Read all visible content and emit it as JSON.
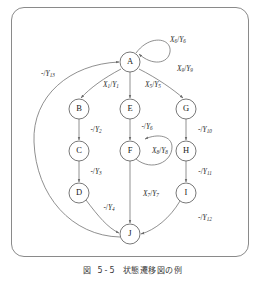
{
  "figure": {
    "caption_number": "図 5-5",
    "caption_text": "状態遷移図の例",
    "frame_color": "#8a8a8a",
    "node_stroke_color": "#555555",
    "edge_color": "#6b6b6b"
  },
  "chart_data": {
    "type": "diagram",
    "title": "状態遷移図の例",
    "diagram_kind": "state-transition-diagram",
    "nodes": [
      {
        "id": "A",
        "label": "A",
        "cx": 130,
        "cy": 62,
        "r": 10
      },
      {
        "id": "B",
        "label": "B",
        "cx": 79,
        "cy": 109,
        "r": 10
      },
      {
        "id": "C",
        "label": "C",
        "cx": 79,
        "cy": 151,
        "r": 10
      },
      {
        "id": "D",
        "label": "D",
        "cx": 79,
        "cy": 193,
        "r": 10
      },
      {
        "id": "E",
        "label": "E",
        "cx": 130,
        "cy": 109,
        "r": 10
      },
      {
        "id": "F",
        "label": "F",
        "cx": 130,
        "cy": 151,
        "r": 10
      },
      {
        "id": "G",
        "label": "G",
        "cx": 186,
        "cy": 109,
        "r": 10
      },
      {
        "id": "H",
        "label": "H",
        "cx": 186,
        "cy": 151,
        "r": 10
      },
      {
        "id": "I",
        "label": "I",
        "cx": 186,
        "cy": 193,
        "r": 10
      },
      {
        "id": "J",
        "label": "J",
        "cx": 130,
        "cy": 234,
        "r": 10
      }
    ],
    "edges": [
      {
        "from": "A",
        "to": "A",
        "input": "X6",
        "output": "Y6",
        "label": "X6/Y6",
        "label_x": 178,
        "label_y": 40
      },
      {
        "from": "A",
        "to": "B",
        "input": "X1",
        "output": "Y1",
        "label": "X1/Y1",
        "label_x": 111,
        "label_y": 85
      },
      {
        "from": "A",
        "to": "E",
        "input": "X5",
        "output": "Y5",
        "label": "X5/Y5",
        "label_x": 153,
        "label_y": 85
      },
      {
        "from": "A",
        "to": "G",
        "input": "X9",
        "output": "Y9",
        "label": "X9/Y9",
        "label_x": 185,
        "label_y": 69
      },
      {
        "from": "B",
        "to": "C",
        "input": "-",
        "output": "Y2",
        "label": "-/Y2",
        "label_x": 96,
        "label_y": 130
      },
      {
        "from": "C",
        "to": "D",
        "input": "-",
        "output": "Y3",
        "label": "-/Y3",
        "label_x": 96,
        "label_y": 172
      },
      {
        "from": "D",
        "to": "J",
        "input": "-",
        "output": "Y4",
        "label": "-/Y4",
        "label_x": 109,
        "label_y": 208
      },
      {
        "from": "E",
        "to": "F",
        "input": "-",
        "output": "Y6",
        "label": "-/Y6",
        "label_x": 147,
        "label_y": 127
      },
      {
        "from": "F",
        "to": "F",
        "input": "X8",
        "output": "Y8",
        "label": "X8/Y8",
        "label_x": 160,
        "label_y": 151
      },
      {
        "from": "F",
        "to": "J",
        "input": "X7",
        "output": "Y7",
        "label": "X7/Y7",
        "label_x": 151,
        "label_y": 194
      },
      {
        "from": "G",
        "to": "H",
        "input": "-",
        "output": "Y10",
        "label": "-/Y10",
        "label_x": 205,
        "label_y": 130
      },
      {
        "from": "H",
        "to": "I",
        "input": "-",
        "output": "Y11",
        "label": "-/Y11",
        "label_x": 205,
        "label_y": 172
      },
      {
        "from": "I",
        "to": "J",
        "input": "-",
        "output": "Y12",
        "label": "-/Y12",
        "label_x": 205,
        "label_y": 218
      },
      {
        "from": "J",
        "to": "A",
        "input": "-",
        "output": "Y13",
        "label": "-/Y13",
        "label_x": 48,
        "label_y": 74
      }
    ]
  }
}
